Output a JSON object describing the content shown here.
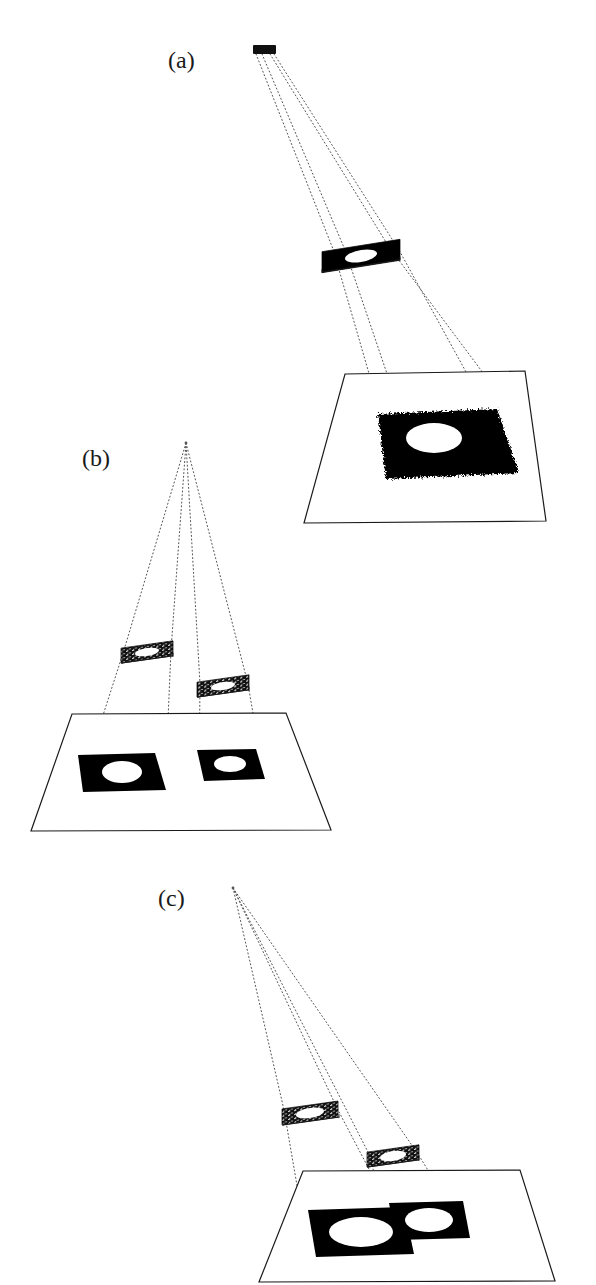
{
  "figure": {
    "top_cut_text": "",
    "background_color": "#ffffff",
    "ink_color": "#000000",
    "ray_color": "#555555",
    "outline_color": "#1a1a1a",
    "width": 596,
    "height": 1285
  },
  "panels": [
    {
      "id": "a",
      "label": "(a)",
      "label_x": 168,
      "label_y": 48,
      "description": "single point source, single aperture mask, single projected spot on screen",
      "source": {
        "name": "point-source",
        "x": 253,
        "y": 45,
        "w": 23,
        "h": 9,
        "fill": "#101010"
      },
      "masks": [
        {
          "name": "aperture-mask-1",
          "cx": 361,
          "cy": 256,
          "w": 78,
          "h": 21,
          "skew": -9,
          "hole_rx": 16,
          "hole_ry": 6,
          "style": "solid",
          "rule_y": 272,
          "rule_x1": 322,
          "rule_x2": 400
        }
      ],
      "screen": {
        "name": "projection-screen",
        "corners": [
          [
            345,
            374
          ],
          [
            525,
            371
          ],
          [
            546,
            521
          ],
          [
            304,
            523
          ]
        ]
      },
      "patches": [
        {
          "name": "projected-spot-1",
          "corners": [
            [
              378,
              414
            ],
            [
              497,
              409
            ],
            [
              519,
              473
            ],
            [
              386,
              479
            ]
          ],
          "hole_cx": 434,
          "hole_cy": 438,
          "hole_rx": 28,
          "hole_ry": 15,
          "rough": true
        }
      ],
      "rays": [
        [
          [
            256,
            54
          ],
          [
            333,
            249
          ],
          [
            381,
            415
          ]
        ],
        [
          [
            262,
            54
          ],
          [
            345,
            250
          ],
          [
            400,
            412
          ]
        ],
        [
          [
            270,
            54
          ],
          [
            389,
            247
          ],
          [
            510,
            409
          ]
        ],
        [
          [
            274,
            54
          ],
          [
            399,
            250
          ],
          [
            521,
            472
          ]
        ]
      ]
    },
    {
      "id": "b",
      "label": "(b)",
      "label_x": 82,
      "label_y": 446,
      "description": "two separated apertures at different depths producing two separated non-overlapping spots",
      "apex": {
        "name": "ray-apex",
        "x": 186,
        "y": 443
      },
      "masks": [
        {
          "name": "aperture-mask-1",
          "cx": 147,
          "cy": 652,
          "w": 52,
          "h": 15,
          "skew": -8,
          "hole_rx": 12,
          "hole_ry": 4,
          "style": "textured",
          "rule_y": 663,
          "rule_x1": 122,
          "rule_x2": 173
        },
        {
          "name": "aperture-mask-2",
          "cx": 223,
          "cy": 686,
          "w": 52,
          "h": 15,
          "skew": -8,
          "hole_rx": 12,
          "hole_ry": 4,
          "style": "textured",
          "rule_y": 697,
          "rule_x1": 198,
          "rule_x2": 249
        }
      ],
      "screen": {
        "name": "projection-screen",
        "corners": [
          [
            72,
            714
          ],
          [
            286,
            713
          ],
          [
            331,
            830
          ],
          [
            31,
            831
          ]
        ]
      },
      "patches": [
        {
          "name": "projected-spot-1",
          "corners": [
            [
              78,
              755
            ],
            [
              155,
              753
            ],
            [
              166,
              790
            ],
            [
              83,
              792
            ]
          ],
          "hole_cx": 122,
          "hole_cy": 772,
          "hole_rx": 20,
          "hole_ry": 11,
          "rough": false
        },
        {
          "name": "projected-spot-2",
          "corners": [
            [
              197,
              750
            ],
            [
              256,
              749
            ],
            [
              265,
              779
            ],
            [
              204,
              781
            ]
          ],
          "hole_cx": 230,
          "hole_cy": 764,
          "hole_rx": 16,
          "hole_ry": 8,
          "rough": false
        }
      ],
      "rays": [
        [
          [
            186,
            443
          ],
          [
            124,
            650
          ],
          [
            79,
            790
          ]
        ],
        [
          [
            186,
            443
          ],
          [
            171,
            650
          ],
          [
            165,
            789
          ]
        ],
        [
          [
            186,
            443
          ],
          [
            200,
            684
          ],
          [
            199,
            780
          ]
        ],
        [
          [
            186,
            443
          ],
          [
            248,
            684
          ],
          [
            264,
            778
          ]
        ]
      ]
    },
    {
      "id": "c",
      "label": "(c)",
      "label_x": 158,
      "label_y": 886,
      "description": "two apertures at different depths producing two overlapping spots on the screen",
      "apex": {
        "name": "ray-apex",
        "x": 233,
        "y": 888
      },
      "masks": [
        {
          "name": "aperture-mask-1",
          "cx": 310,
          "cy": 1113,
          "w": 56,
          "h": 16,
          "skew": -8,
          "hole_rx": 14,
          "hole_ry": 5,
          "style": "textured",
          "rule_y": 1125,
          "rule_x1": 283,
          "rule_x2": 339
        },
        {
          "name": "aperture-mask-2",
          "cx": 393,
          "cy": 1156,
          "w": 52,
          "h": 15,
          "skew": -8,
          "hole_rx": 13,
          "hole_ry": 5,
          "style": "textured",
          "rule_y": 1167,
          "rule_x1": 368,
          "rule_x2": 419
        }
      ],
      "screen": {
        "name": "projection-screen",
        "corners": [
          [
            303,
            1171
          ],
          [
            520,
            1170
          ],
          [
            555,
            1281
          ],
          [
            259,
            1282
          ]
        ]
      },
      "patches": [
        {
          "name": "projected-spot-1",
          "corners": [
            [
              308,
              1210
            ],
            [
              404,
              1207
            ],
            [
              414,
              1254
            ],
            [
              316,
              1257
            ]
          ],
          "hole_cx": 361,
          "hole_cy": 1232,
          "hole_rx": 32,
          "hole_ry": 15,
          "rough": false
        },
        {
          "name": "projected-spot-2",
          "corners": [
            [
              389,
              1203
            ],
            [
              463,
              1201
            ],
            [
              470,
              1238
            ],
            [
              396,
              1240
            ]
          ],
          "hole_cx": 429,
          "hole_cy": 1220,
          "hole_rx": 24,
          "hole_ry": 12,
          "rough": false
        }
      ],
      "rays": [
        [
          [
            233,
            888
          ],
          [
            284,
            1110
          ],
          [
            309,
            1255
          ]
        ],
        [
          [
            233,
            888
          ],
          [
            338,
            1110
          ],
          [
            413,
            1253
          ]
        ],
        [
          [
            233,
            888
          ],
          [
            369,
            1154
          ],
          [
            392,
            1239
          ]
        ],
        [
          [
            233,
            888
          ],
          [
            418,
            1154
          ],
          [
            469,
            1237
          ]
        ]
      ]
    }
  ]
}
